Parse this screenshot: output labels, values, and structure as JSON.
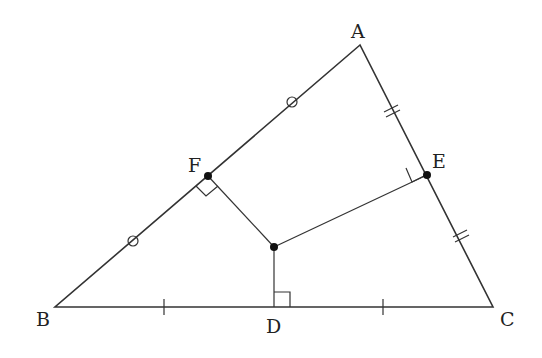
{
  "diagram": {
    "type": "geometry-triangle-circumcenter",
    "points": {
      "A": {
        "label": "A",
        "x": 360,
        "y": 45
      },
      "B": {
        "label": "B",
        "x": 55,
        "y": 307
      },
      "C": {
        "label": "C",
        "x": 493,
        "y": 307
      },
      "D": {
        "label": "D",
        "x": 274,
        "y": 307
      },
      "E": {
        "label": "E",
        "x": 427,
        "y": 175
      },
      "F": {
        "label": "F",
        "x": 208,
        "y": 176
      },
      "O": {
        "label": "",
        "x": 274,
        "y": 247
      }
    },
    "labels": {
      "A": "A",
      "B": "B",
      "C": "C",
      "D": "D",
      "E": "E",
      "F": "F"
    },
    "marks": {
      "AB": "circle ticks (BF = FA)",
      "AC": "double ticks (AE = EC)",
      "BC": "single ticks (BD = DC)",
      "right_angles": [
        "F",
        "E",
        "D"
      ]
    }
  }
}
